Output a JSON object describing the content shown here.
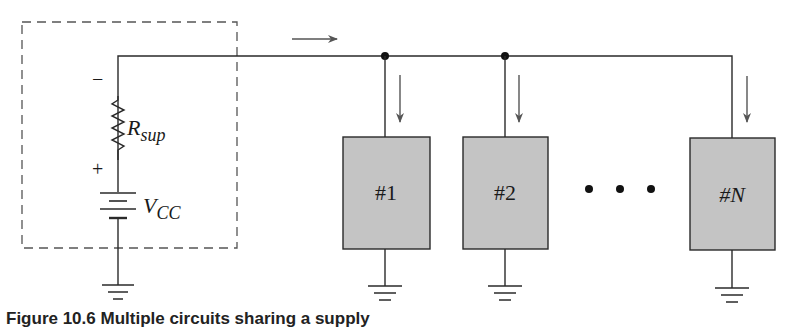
{
  "diagram": {
    "colors": {
      "wire": "#2a2a2a",
      "dashed_box": "#555555",
      "load_fill": "#c4c4c4",
      "load_stroke": "#2a2a2a",
      "arrow": "#555555",
      "background": "#ffffff"
    },
    "supply": {
      "resistor_label": "R",
      "resistor_subscript": "sup",
      "minus_sign": "−",
      "plus_sign": "+",
      "source_label": "V",
      "source_subscript": "CC"
    },
    "loads": [
      {
        "label": "#1"
      },
      {
        "label": "#2"
      },
      {
        "label": "#N"
      }
    ],
    "ellipsis": "• • •",
    "caption": "Figure 10.6  Multiple circuits sharing a supply"
  }
}
